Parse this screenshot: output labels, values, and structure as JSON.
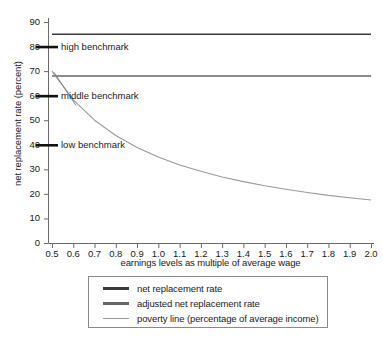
{
  "chart_data": {
    "type": "line",
    "title": "",
    "xlabel": "earnings levels as multiple of average wage",
    "ylabel": "net replacement rate (percent)",
    "xlim": [
      0.5,
      2.0
    ],
    "ylim": [
      0,
      90
    ],
    "grid": false,
    "legend_position": "bottom",
    "xticks": [
      "0.5",
      "0.6",
      "0.7",
      "0.8",
      "0.9",
      "1.0",
      "1.1",
      "1.2",
      "1.3",
      "1.4",
      "1.5",
      "1.6",
      "1.7",
      "1.8",
      "1.9",
      "2.0"
    ],
    "xtick_values": [
      0.5,
      0.6,
      0.7,
      0.8,
      0.9,
      1.0,
      1.1,
      1.2,
      1.3,
      1.4,
      1.5,
      1.6,
      1.7,
      1.8,
      1.9,
      2.0
    ],
    "yticks": [
      "0",
      "10",
      "20",
      "30",
      "40",
      "50",
      "60",
      "70",
      "80",
      "90"
    ],
    "ytick_values": [
      0,
      10,
      20,
      30,
      40,
      50,
      60,
      70,
      80,
      90
    ],
    "x": [
      0.5,
      0.6,
      0.7,
      0.8,
      0.9,
      1.0,
      1.1,
      1.2,
      1.3,
      1.4,
      1.5,
      1.6,
      1.7,
      1.8,
      1.9,
      2.0
    ],
    "series": [
      {
        "name": "net replacement rate",
        "color": "#3a3a3a",
        "values": [
          85,
          85,
          85,
          85,
          85,
          85,
          85,
          85,
          85,
          85,
          85,
          85,
          85,
          85,
          85,
          85
        ]
      },
      {
        "name": "adjusted net replacement rate",
        "color": "#666666",
        "values": [
          68,
          68,
          68,
          68,
          68,
          68,
          68,
          68,
          68,
          68,
          68,
          68,
          68,
          68,
          68,
          68
        ]
      },
      {
        "name": "poverty line (percentage of average income)",
        "color": "#9a9a9a",
        "values": [
          70,
          58.3,
          50,
          43.8,
          38.9,
          35,
          31.8,
          29.2,
          26.9,
          25,
          23.3,
          21.9,
          20.6,
          19.4,
          18.4,
          17.5
        ]
      }
    ],
    "annotations": [
      {
        "label": "high benchmark",
        "value": 80,
        "color": "#111111"
      },
      {
        "label": "middle benchmark",
        "value": 60,
        "color": "#111111"
      },
      {
        "label": "low benchmark",
        "value": 40,
        "color": "#111111"
      }
    ]
  },
  "legend": {
    "entries": [
      {
        "label": "net replacement rate",
        "color": "#3a3a3a"
      },
      {
        "label": "adjusted net replacement rate",
        "color": "#666666"
      },
      {
        "label": "poverty line (percentage of average income)",
        "color": "#9a9a9a"
      }
    ]
  },
  "axes": {
    "axis_color": "#6a6a6a",
    "text_color": "#1a1a1a"
  }
}
